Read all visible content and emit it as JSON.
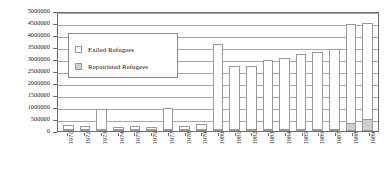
{
  "chart_data": {
    "type": "bar",
    "subtype": "stacked-bar",
    "title": "",
    "subtitle": "",
    "xlabel": "",
    "ylabel": "",
    "ylim": [
      0,
      5000000
    ],
    "ytick_step": 500000,
    "grid": true,
    "legend_position": "inside-upper-left",
    "categories": [
      "1971",
      "1972",
      "1973",
      "1974",
      "1975",
      "1976",
      "1977",
      "1978",
      "1979",
      "1980",
      "1981",
      "1982",
      "1983",
      "1984",
      "1985",
      "1986",
      "1987",
      "1988",
      "1989"
    ],
    "ytick_labels": [
      "5000000",
      "4500000",
      "4000000",
      "3500000",
      "3000000",
      "2500000",
      "2000000",
      "1500000",
      "1000000",
      "500000",
      "0"
    ],
    "ytick_values": [
      5000000,
      4500000,
      4000000,
      3500000,
      3000000,
      2500000,
      2000000,
      1500000,
      1000000,
      500000,
      0
    ],
    "series": [
      {
        "name": "Exiled Refugees",
        "color": "#ffffff",
        "border": "#9a9a9a",
        "values": [
          180000,
          120000,
          870000,
          120000,
          130000,
          110000,
          880000,
          130000,
          250000,
          3600000,
          2700000,
          2700000,
          2950000,
          3050000,
          3200000,
          3300000,
          3400000,
          4450000,
          4500000
        ]
      },
      {
        "name": "Repatriated Refugees",
        "color": "#cfcfcf",
        "border": "#9a9a9a",
        "values": [
          20000,
          15000,
          25000,
          20000,
          25000,
          20000,
          25000,
          20000,
          30000,
          60000,
          60000,
          70000,
          80000,
          80000,
          90000,
          90000,
          100000,
          330000,
          480000
        ]
      }
    ]
  },
  "legend": {
    "items": [
      {
        "label": "Exiled Refugees",
        "swatch": "legend-swatch-exiled"
      },
      {
        "label": "Repatriated Refugees",
        "swatch": "legend-swatch-repatriated"
      }
    ]
  }
}
